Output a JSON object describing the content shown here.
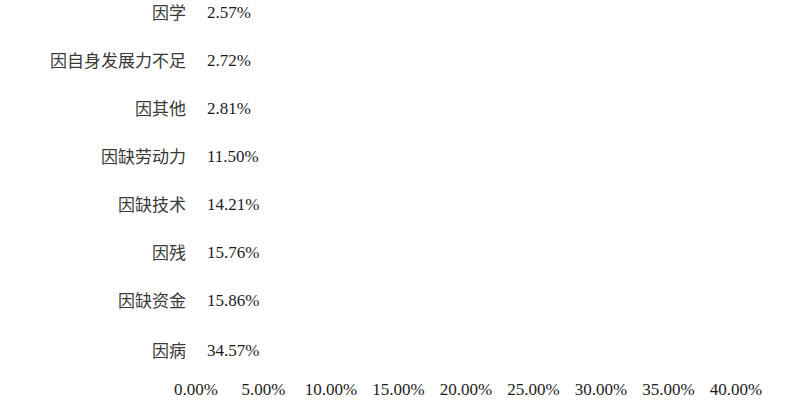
{
  "chart_data": {
    "type": "bar",
    "orientation": "horizontal",
    "title": "",
    "subtitle": "",
    "xlabel": "",
    "ylabel": "",
    "grid": false,
    "legend": null,
    "legend_position": "none",
    "bar_color": "#d3d3d3",
    "text_color": "#1c1c1c",
    "background_color": "#ffffff",
    "xlim": [
      0,
      40
    ],
    "xtick_step": 5,
    "xtick_labels": [
      "0.00%",
      "5.00%",
      "10.00%",
      "15.00%",
      "20.00%",
      "25.00%",
      "30.00%",
      "35.00%",
      "40.00%"
    ],
    "xtick_values": [
      0,
      5,
      10,
      15,
      20,
      25,
      30,
      35,
      40
    ],
    "categories": [
      "因学",
      "因自身发展力不足",
      "因其他",
      "因缺劳动力",
      "因缺技术",
      "因残",
      "因缺资金",
      "因病"
    ],
    "values": [
      2.57,
      2.72,
      2.81,
      11.5,
      14.21,
      15.76,
      15.86,
      34.57
    ],
    "data_labels": [
      "2.57%",
      "2.72%",
      "2.81%",
      "11.50%",
      "14.21%",
      "15.76%",
      "15.86%",
      "34.57%"
    ]
  }
}
